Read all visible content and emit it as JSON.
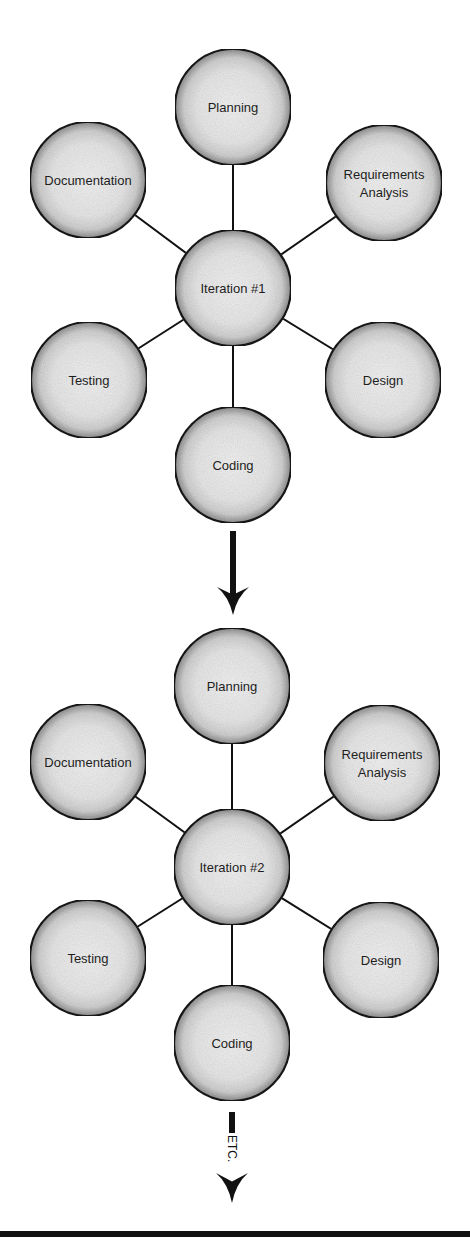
{
  "diagram": {
    "iterations": [
      {
        "center": {
          "label": "Iteration #1",
          "cx": 233,
          "cy": 288,
          "r": 58
        },
        "phases": [
          {
            "id": "planning",
            "lines": [
              "Planning"
            ],
            "cx": 233,
            "cy": 107,
            "r": 58
          },
          {
            "id": "requirements-analysis",
            "lines": [
              "Requirements",
              "Analysis"
            ],
            "cx": 384,
            "cy": 183,
            "r": 58
          },
          {
            "id": "design",
            "lines": [
              "Design"
            ],
            "cx": 383,
            "cy": 380,
            "r": 58
          },
          {
            "id": "coding",
            "lines": [
              "Coding"
            ],
            "cx": 233,
            "cy": 465,
            "r": 58
          },
          {
            "id": "testing",
            "lines": [
              "Testing"
            ],
            "cx": 89,
            "cy": 380,
            "r": 58
          },
          {
            "id": "documentation",
            "lines": [
              "Documentation"
            ],
            "cx": 88,
            "cy": 180,
            "r": 58
          }
        ]
      },
      {
        "center": {
          "label": "Iteration #2",
          "cx": 232,
          "cy": 867,
          "r": 58
        },
        "phases": [
          {
            "id": "planning",
            "lines": [
              "Planning"
            ],
            "cx": 232,
            "cy": 686,
            "r": 58
          },
          {
            "id": "requirements-analysis",
            "lines": [
              "Requirements",
              "Analysis"
            ],
            "cx": 382,
            "cy": 763,
            "r": 58
          },
          {
            "id": "design",
            "lines": [
              "Design"
            ],
            "cx": 381,
            "cy": 960,
            "r": 58
          },
          {
            "id": "coding",
            "lines": [
              "Coding"
            ],
            "cx": 232,
            "cy": 1043,
            "r": 58
          },
          {
            "id": "testing",
            "lines": [
              "Testing"
            ],
            "cx": 88,
            "cy": 958,
            "r": 58
          },
          {
            "id": "documentation",
            "lines": [
              "Documentation"
            ],
            "cx": 88,
            "cy": 762,
            "r": 58
          }
        ]
      }
    ],
    "arrows": [
      {
        "id": "iteration-transition",
        "x": 233,
        "shaft_top": 531,
        "head_top": 587,
        "tip": 615,
        "label": ""
      },
      {
        "id": "continuation",
        "x": 232,
        "shaft_top": 1112,
        "head_top": 1173,
        "tip": 1203,
        "label": "ETC."
      }
    ],
    "colors": {
      "node_fill": "#e9e9e9",
      "node_edge_shade": "#9a9a9a",
      "stroke": "#151515",
      "text": "#1e1e1e",
      "background": "#ffffff"
    }
  }
}
